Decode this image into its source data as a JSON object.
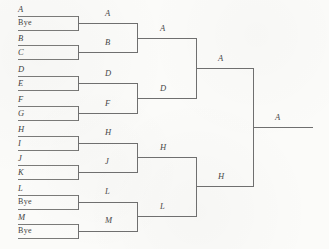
{
  "diagram": {
    "type": "single-elimination-tournament-bracket",
    "entrant_count": 14,
    "rounds": 4,
    "champion": "A",
    "colors": {
      "paper": "#fbfbf9",
      "line": "#6f6f6f",
      "text": "#3f3f3f"
    }
  },
  "round1": {
    "label": "Round 1",
    "matches": [
      {
        "top": "A",
        "bottom": "Bye",
        "winner": "A"
      },
      {
        "top": "B",
        "bottom": "C",
        "winner": "B"
      },
      {
        "top": "D",
        "bottom": "E",
        "winner": "D"
      },
      {
        "top": "F",
        "bottom": "G",
        "winner": "F"
      },
      {
        "top": "H",
        "bottom": "I",
        "winner": "H"
      },
      {
        "top": "J",
        "bottom": "K",
        "winner": "J"
      },
      {
        "top": "L",
        "bottom": "Bye",
        "winner": "L"
      },
      {
        "top": "M",
        "bottom": "Bye",
        "winner": "M"
      }
    ]
  },
  "round2": {
    "label": "Round 2",
    "matches": [
      {
        "top": "A",
        "bottom": "B",
        "winner": "A"
      },
      {
        "top": "D",
        "bottom": "F",
        "winner": "D"
      },
      {
        "top": "H",
        "bottom": "J",
        "winner": "H"
      },
      {
        "top": "L",
        "bottom": "M",
        "winner": "L"
      }
    ]
  },
  "round3": {
    "label": "Semifinals",
    "matches": [
      {
        "top": "A",
        "bottom": "D",
        "winner": "A"
      },
      {
        "top": "H",
        "bottom": "L",
        "winner": "H"
      }
    ]
  },
  "round4": {
    "label": "Final",
    "matches": [
      {
        "top": "A",
        "bottom": "H",
        "winner": "A"
      }
    ]
  },
  "seed_labels": [
    {
      "text": "A",
      "x": 18,
      "y": 6,
      "bye": false
    },
    {
      "text": "Bye",
      "x": 18,
      "y": 21,
      "bye": true
    },
    {
      "text": "B",
      "x": 18,
      "y": 34,
      "bye": false
    },
    {
      "text": "C",
      "x": 18,
      "y": 49,
      "bye": false
    },
    {
      "text": "D",
      "x": 18,
      "y": 66,
      "bye": false
    },
    {
      "text": "E",
      "x": 18,
      "y": 81,
      "bye": false
    },
    {
      "text": "F",
      "x": 18,
      "y": 96,
      "bye": false
    },
    {
      "text": "G",
      "x": 18,
      "y": 111,
      "bye": false
    },
    {
      "text": "H",
      "x": 18,
      "y": 126,
      "bye": false
    },
    {
      "text": "I",
      "x": 18,
      "y": 141,
      "bye": false
    },
    {
      "text": "J",
      "x": 18,
      "y": 156,
      "bye": false
    },
    {
      "text": "K",
      "x": 18,
      "y": 170,
      "bye": false
    },
    {
      "text": "L",
      "x": 18,
      "y": 186,
      "bye": false
    },
    {
      "text": "Bye",
      "x": 18,
      "y": 200,
      "bye": true
    },
    {
      "text": "M",
      "x": 18,
      "y": 215,
      "bye": false
    },
    {
      "text": "Bye",
      "x": 18,
      "y": 229,
      "bye": true
    }
  ],
  "round_labels": [
    {
      "text": "A",
      "x": 105,
      "y": 9
    },
    {
      "text": "B",
      "x": 105,
      "y": 38
    },
    {
      "text": "D",
      "x": 105,
      "y": 70
    },
    {
      "text": "F",
      "x": 105,
      "y": 99
    },
    {
      "text": "H",
      "x": 105,
      "y": 128
    },
    {
      "text": "J",
      "x": 105,
      "y": 157
    },
    {
      "text": "L",
      "x": 105,
      "y": 187
    },
    {
      "text": "M",
      "x": 105,
      "y": 216
    },
    {
      "text": "A",
      "x": 160,
      "y": 25
    },
    {
      "text": "D",
      "x": 160,
      "y": 84
    },
    {
      "text": "H",
      "x": 160,
      "y": 143
    },
    {
      "text": "L",
      "x": 160,
      "y": 202
    },
    {
      "text": "A",
      "x": 218,
      "y": 57
    },
    {
      "text": "H",
      "x": 218,
      "y": 172
    },
    {
      "text": "A",
      "x": 275,
      "y": 113
    }
  ]
}
